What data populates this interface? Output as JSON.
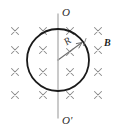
{
  "figure": {
    "background_color": "#ffffff",
    "width": 123,
    "height": 136
  },
  "labels": {
    "axis_top": "O",
    "axis_bottom": "O'",
    "radius": "R",
    "field": "B"
  },
  "colors": {
    "loop_stroke": "#1a1a1a",
    "axis_stroke": "#b4b4b4",
    "radius_stroke": "#6e6e6e",
    "cross_stroke": "#8a8a8a",
    "text": "#2b2b2b"
  },
  "geometry": {
    "loop": {
      "cx": 58,
      "cy": 60,
      "r": 31,
      "stroke_width": 1.8
    },
    "axis": {
      "x": 58,
      "y_top": 14,
      "y_bottom": 118,
      "stroke_width": 1.4
    },
    "radius_arrow": {
      "x1": 58,
      "y1": 60,
      "x2": 83,
      "y2": 42,
      "stroke_width": 1.1
    }
  },
  "field_marks": {
    "symbol": "cross",
    "meaning": "magnetic field into the page",
    "columns_x": [
      15,
      43,
      70,
      98
    ],
    "rows_y": [
      31,
      50,
      72,
      95
    ],
    "size": 7,
    "count": 16
  }
}
